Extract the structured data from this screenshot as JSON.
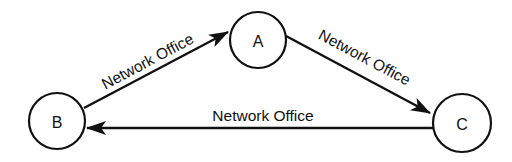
{
  "diagram": {
    "type": "directed-cycle",
    "nodes": [
      {
        "id": "A",
        "label": "A",
        "cx": 258,
        "cy": 40,
        "r": 28
      },
      {
        "id": "B",
        "label": "B",
        "cx": 57,
        "cy": 121,
        "r": 28
      },
      {
        "id": "C",
        "label": "C",
        "cx": 462,
        "cy": 123,
        "r": 29
      }
    ],
    "edges": [
      {
        "from": "B",
        "to": "A",
        "label": "Network Office"
      },
      {
        "from": "A",
        "to": "C",
        "label": "Network Office"
      },
      {
        "from": "C",
        "to": "B",
        "label": "Network Office"
      }
    ],
    "colors": {
      "stroke": "#111111",
      "background": "#ffffff"
    }
  }
}
